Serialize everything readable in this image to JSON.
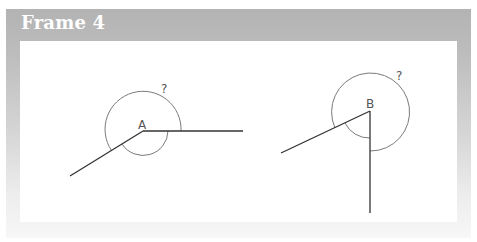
{
  "frame": {
    "title": "Frame 4",
    "header_color": "#b3b3b3",
    "title_color": "#ffffff"
  },
  "diagram": {
    "figures": [
      {
        "vertex_label": "A",
        "unknown_angle_label": "?",
        "description": "Reflex angle at A between a horizontal ray to the right and a ray down-left; large arc marks the reflex angle (?), small arc marks the interior angle"
      },
      {
        "vertex_label": "B",
        "unknown_angle_label": "?",
        "description": "Reflex angle at B between a vertical ray downward and a ray down-left; large arc marks the reflex angle (?), small arc marks the interior angle"
      }
    ],
    "line_color": "#333333",
    "arc_color": "#777777"
  }
}
